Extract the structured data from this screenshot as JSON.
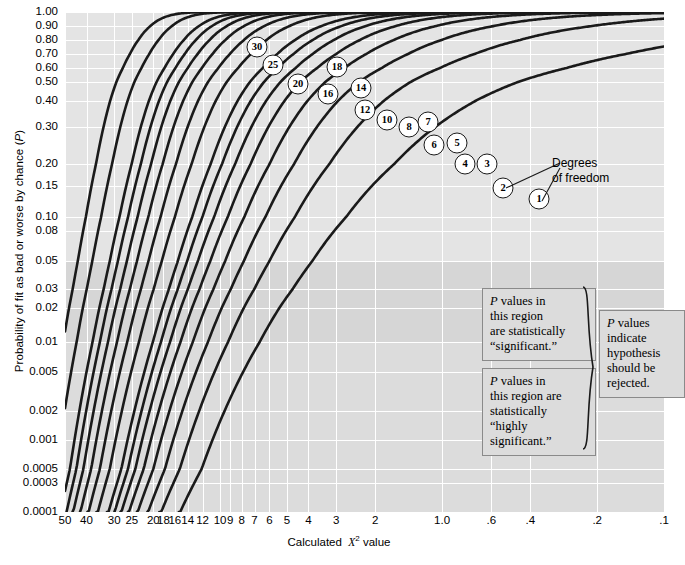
{
  "chart_data": {
    "type": "line",
    "title": "",
    "xlabel": "Calculated χ² value",
    "ylabel": "Probability of fit as bad or worse by chance (P)",
    "x_axis_reversed": true,
    "x_scale": "log",
    "y_scale": "probit-like",
    "xlim": [
      50,
      0.1
    ],
    "ylim": [
      0.0001,
      1.0
    ],
    "grid": true,
    "legend": "inline-bubble-labels",
    "x_ticks": [
      {
        "label": "50",
        "value": 50
      },
      {
        "label": "40",
        "value": 40
      },
      {
        "label": "30",
        "value": 30
      },
      {
        "label": "25",
        "value": 25
      },
      {
        "label": "20",
        "value": 20
      },
      {
        "label": "18",
        "value": 18
      },
      {
        "label": "16",
        "value": 16
      },
      {
        "label": "14",
        "value": 14
      },
      {
        "label": "12",
        "value": 12
      },
      {
        "label": "10",
        "value": 10
      },
      {
        "label": "9",
        "value": 9
      },
      {
        "label": "8",
        "value": 8
      },
      {
        "label": "7",
        "value": 7
      },
      {
        "label": "6",
        "value": 6
      },
      {
        "label": "5",
        "value": 5
      },
      {
        "label": "4",
        "value": 4
      },
      {
        "label": "3",
        "value": 3
      },
      {
        "label": "2",
        "value": 2
      },
      {
        "label": "1.0",
        "value": 1.0
      },
      {
        "label": ".6",
        "value": 0.6
      },
      {
        "label": ".4",
        "value": 0.4
      },
      {
        "label": ".2",
        "value": 0.2
      },
      {
        "label": ".1",
        "value": 0.1
      }
    ],
    "y_ticks": [
      {
        "label": "1.00",
        "value": 1.0
      },
      {
        "label": "0.90",
        "value": 0.9
      },
      {
        "label": "0.80",
        "value": 0.8
      },
      {
        "label": "0.70",
        "value": 0.7
      },
      {
        "label": "0.60",
        "value": 0.6
      },
      {
        "label": "0.50",
        "value": 0.5
      },
      {
        "label": "0.40",
        "value": 0.4
      },
      {
        "label": "0.30",
        "value": 0.3
      },
      {
        "label": "0.20",
        "value": 0.2
      },
      {
        "label": "0.15",
        "value": 0.15
      },
      {
        "label": "0.10",
        "value": 0.1
      },
      {
        "label": "0.08",
        "value": 0.08
      },
      {
        "label": "0.05",
        "value": 0.05
      },
      {
        "label": "0.03",
        "value": 0.03
      },
      {
        "label": "0.02",
        "value": 0.02
      },
      {
        "label": "0.01",
        "value": 0.01
      },
      {
        "label": "0.005",
        "value": 0.005
      },
      {
        "label": "0.002",
        "value": 0.002
      },
      {
        "label": "0.001",
        "value": 0.001
      },
      {
        "label": "0.0005",
        "value": 0.0005
      },
      {
        "label": "0.0003",
        "value": 0.0003
      },
      {
        "label": "0.0001",
        "value": 0.0001
      }
    ],
    "series": [
      {
        "name": "30",
        "df": 30
      },
      {
        "name": "25",
        "df": 25
      },
      {
        "name": "20",
        "df": 20
      },
      {
        "name": "18",
        "df": 18
      },
      {
        "name": "16",
        "df": 16
      },
      {
        "name": "14",
        "df": 14
      },
      {
        "name": "12",
        "df": 12
      },
      {
        "name": "10",
        "df": 10
      },
      {
        "name": "8",
        "df": 8
      },
      {
        "name": "7",
        "df": 7
      },
      {
        "name": "6",
        "df": 6
      },
      {
        "name": "5",
        "df": 5
      },
      {
        "name": "4",
        "df": 4
      },
      {
        "name": "3",
        "df": 3
      },
      {
        "name": "2",
        "df": 2
      },
      {
        "name": "1",
        "df": 1
      }
    ],
    "bands": [
      {
        "name": "non-significant",
        "from": 1.0,
        "to": 0.05,
        "shade": "#e4e4e4"
      },
      {
        "name": "significant",
        "from": 0.05,
        "to": 0.01,
        "shade": "#d6d6d6"
      },
      {
        "name": "highly-significant",
        "from": 0.01,
        "to": 0.0001,
        "shade": "#dcdcdc"
      }
    ],
    "colors": {
      "plot_background": "#e2e2e2",
      "gridline": "#ffffff",
      "curve": "#1a1a1a",
      "band_significant": "#d6d6d6",
      "callout_box": "#dcdcdc",
      "callout_border": "#8a8a8a"
    }
  },
  "annotations": {
    "degrees_of_freedom": "Degrees\nof freedom",
    "degrees_of_freedom_line1": "Degrees",
    "degrees_of_freedom_line2": "of freedom",
    "boxes": [
      {
        "id": "significant",
        "lines": [
          "P values in",
          "this region",
          "are statistically",
          "“significant.”"
        ]
      },
      {
        "id": "highly-significant",
        "lines": [
          "P values in",
          "this region are",
          "statistically",
          "“highly",
          "significant.”"
        ]
      },
      {
        "id": "reject",
        "lines": [
          "P values",
          "indicate",
          "hypothesis",
          "should be",
          "rejected."
        ]
      }
    ]
  },
  "bubbles": [
    {
      "label": "30",
      "x": 257,
      "y": 47
    },
    {
      "label": "25",
      "x": 273,
      "y": 65
    },
    {
      "label": "20",
      "x": 298,
      "y": 84
    },
    {
      "label": "18",
      "x": 337,
      "y": 67
    },
    {
      "label": "16",
      "x": 328,
      "y": 94
    },
    {
      "label": "14",
      "x": 361,
      "y": 88
    },
    {
      "label": "12",
      "x": 365,
      "y": 110
    },
    {
      "label": "10",
      "x": 387,
      "y": 120
    },
    {
      "label": "8",
      "x": 409,
      "y": 127
    },
    {
      "label": "7",
      "x": 428,
      "y": 122
    },
    {
      "label": "6",
      "x": 434,
      "y": 145
    },
    {
      "label": "5",
      "x": 457,
      "y": 143
    },
    {
      "label": "4",
      "x": 465,
      "y": 164
    },
    {
      "label": "3",
      "x": 487,
      "y": 164
    },
    {
      "label": "2",
      "x": 503,
      "y": 188
    },
    {
      "label": "1",
      "x": 539,
      "y": 199
    }
  ]
}
